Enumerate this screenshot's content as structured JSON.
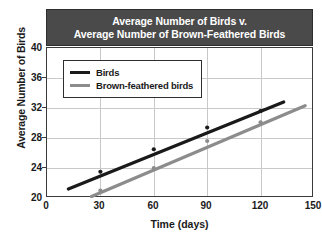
{
  "chart_data": {
    "type": "line",
    "title": "Average Number of Birds v. Average Number of Brown-Feathered Birds",
    "title_line1": "Average Number of Birds v.",
    "title_line2": "Average Number of Brown-Feathered Birds",
    "xlabel": "Time (days)",
    "ylabel": "Average Number of Birds",
    "xlim": [
      0,
      150
    ],
    "ylim": [
      20,
      40
    ],
    "xticks": [
      0,
      30,
      60,
      90,
      120,
      150
    ],
    "yticks": [
      20,
      24,
      28,
      32,
      36,
      40
    ],
    "xtick_labels": [
      "0",
      "30",
      "60",
      "90",
      "120",
      "150"
    ],
    "ytick_labels": [
      "20",
      "24",
      "28",
      "32",
      "36",
      "40"
    ],
    "grid": true,
    "legend_position": "upper-left-inside",
    "series": [
      {
        "name": "Birds",
        "color": "#1a1a1a",
        "trend_start": {
          "x": 12,
          "y": 21.2
        },
        "trend_end": {
          "x": 133,
          "y": 32.8
        },
        "x": [
          30,
          60,
          90,
          120
        ],
        "values": [
          23.5,
          26.5,
          29.4,
          31.6
        ]
      },
      {
        "name": "Brown-feathered birds",
        "color": "#8c8c8c",
        "trend_start": {
          "x": 25,
          "y": 20.2
        },
        "trend_end": {
          "x": 145,
          "y": 32.3
        },
        "x": [
          30,
          60,
          90,
          120
        ],
        "values": [
          21.0,
          24.0,
          27.6,
          30.1
        ]
      }
    ]
  },
  "legend": {
    "items": [
      {
        "label": "Birds"
      },
      {
        "label": "Brown-feathered birds"
      }
    ]
  },
  "colors": {
    "banner_bg": "#4a4a4a",
    "banner_text": "#ffffff",
    "grid": "#c9c9c9",
    "frame": "#3a3a3a",
    "series_birds": "#1a1a1a",
    "series_brown": "#8c8c8c"
  }
}
